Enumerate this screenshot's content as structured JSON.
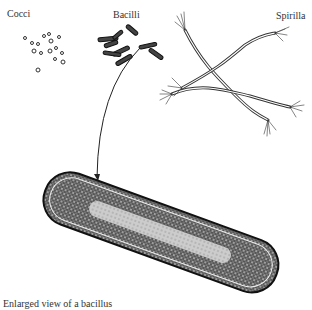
{
  "labels": {
    "cocci": "Cocci",
    "bacilli": "Bacilli",
    "spirilla": "Spirilla",
    "caption": "Enlarged view of a bacillus"
  },
  "colors": {
    "ink": "#222222",
    "background": "#ffffff"
  }
}
